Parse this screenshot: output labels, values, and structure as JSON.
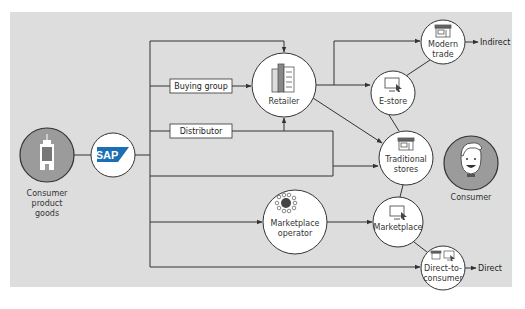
{
  "diagram": {
    "colors": {
      "panel_bg": "#dddddd",
      "line": "#333333",
      "node_fill": "#ffffff",
      "actor_fill": "#9b9b9b",
      "sap_blue": "#1b6fb5",
      "marketplace_dot": "#c0392b"
    },
    "nodes": {
      "cpg": {
        "label_line1": "Consumer",
        "label_line2": "product",
        "label_line3": "goods",
        "icon": "building-icon"
      },
      "sap": {
        "label": "SAP",
        "icon": "sap-logo"
      },
      "buying_group": {
        "label": "Buying group"
      },
      "distributor": {
        "label": "Distributor"
      },
      "retailer": {
        "label": "Retailer",
        "icon": "office-buildings-icon"
      },
      "marketplace_operator": {
        "label_line1": "Marketplace",
        "label_line2": "operator",
        "icon": "network-hub-icon"
      },
      "modern_trade": {
        "label_line1": "Modern",
        "label_line2": "trade",
        "icon": "storefront-icon"
      },
      "e_store": {
        "label": "E-store",
        "icon": "computer-cursor-icon"
      },
      "traditional_stores": {
        "label_line1": "Traditional",
        "label_line2": "stores",
        "icon": "storefront-icon"
      },
      "marketplace": {
        "label": "Marketplace",
        "icon": "computer-cursor-icon"
      },
      "direct_to_consumer": {
        "label_line1": "Direct-to-",
        "label_line2": "consumer",
        "icon": "storefront-and-computer-icon"
      },
      "consumer": {
        "label": "Consumer",
        "icon": "smiling-person-icon"
      }
    },
    "channel_labels": {
      "indirect": "Indirect",
      "direct": "Direct"
    }
  },
  "caption": ""
}
